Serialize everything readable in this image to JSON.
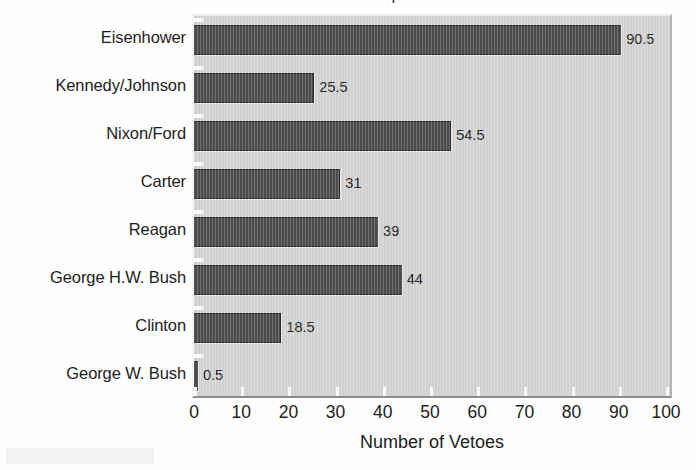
{
  "figure": {
    "clipped_title": "Presidential Vetoes per Year",
    "background_color": "#fefefe",
    "plot_background_color": "#d2d2d2",
    "bar_color": "#4b4b4b",
    "text_color": "#1d1d1d"
  },
  "axis": {
    "x_title": "Number of Vetoes",
    "x_ticks": [
      "0",
      "10",
      "20",
      "30",
      "40",
      "50",
      "60",
      "70",
      "80",
      "90",
      "100"
    ]
  },
  "categories": [
    {
      "label": "Eisenhower",
      "value": "90.5"
    },
    {
      "label": "Kennedy/Johnson",
      "value": "25.5"
    },
    {
      "label": "Nixon/Ford",
      "value": "54.5"
    },
    {
      "label": "Carter",
      "value": "31"
    },
    {
      "label": "Reagan",
      "value": "39"
    },
    {
      "label": "George H.W. Bush",
      "value": "44"
    },
    {
      "label": "Clinton",
      "value": "18.5"
    },
    {
      "label": "George W. Bush",
      "value": "0.5"
    }
  ],
  "chart_data": {
    "type": "bar",
    "orientation": "horizontal",
    "title": "",
    "xlabel": "Number of Vetoes",
    "ylabel": "",
    "categories": [
      "Eisenhower",
      "Kennedy/Johnson",
      "Nixon/Ford",
      "Carter",
      "Reagan",
      "George H.W. Bush",
      "Clinton",
      "George W. Bush"
    ],
    "values": [
      90.5,
      25.5,
      54.5,
      31,
      39,
      44,
      18.5,
      0.5
    ],
    "data_labels": [
      "90.5",
      "25.5",
      "54.5",
      "31",
      "39",
      "44",
      "18.5",
      "0.5"
    ],
    "xlim": [
      0,
      100
    ],
    "xticks": [
      0,
      10,
      20,
      30,
      40,
      50,
      60,
      70,
      80,
      90,
      100
    ],
    "grid": false,
    "legend": null,
    "bar_color": "#4b4b4b",
    "plot_background": "#d2d2d2",
    "annotations": []
  }
}
